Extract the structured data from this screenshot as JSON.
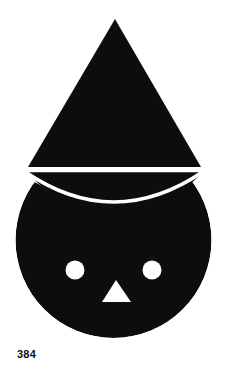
{
  "figure": {
    "caption": "384",
    "background_color": "#ffffff",
    "ink_color": "#0d0d0d",
    "cutout_color": "#ffffff",
    "parts": {
      "hat": {
        "name": "triangular-hat",
        "shape": "triangle",
        "apex_x": 115,
        "apex_y": 19,
        "base_left_x": 28,
        "base_right_x": 201,
        "base_y": 167
      },
      "brim_gap": {
        "name": "horizontal-white-gap",
        "shape": "line",
        "x1": 27,
        "y1": 170.5,
        "x2": 203,
        "y2": 170.5,
        "thickness": 3.4
      },
      "bowl": {
        "name": "hat-underside-bowl",
        "shape": "segment",
        "left_x": 27,
        "right_x": 203,
        "top_y": 172,
        "bottom_y": 222
      },
      "bowl_gap": {
        "name": "curved-white-gap",
        "shape": "arc",
        "start_x": 26,
        "start_y": 172,
        "end_x": 204,
        "end_y": 172,
        "sag_y": 226,
        "thickness": 3.6
      },
      "head": {
        "name": "head-circle",
        "shape": "circle",
        "center_x": 113.5,
        "center_y": 240,
        "radius": 98
      },
      "left_eye": {
        "name": "left-eye",
        "shape": "circle",
        "center_x": 75,
        "center_y": 270,
        "radius": 9.5
      },
      "right_eye": {
        "name": "right-eye",
        "shape": "circle",
        "center_x": 152,
        "center_y": 270,
        "radius": 9.5
      },
      "nose": {
        "name": "nose-triangle",
        "shape": "triangle",
        "apex_x": 116,
        "apex_y": 280,
        "base_left_x": 102,
        "base_right_x": 131,
        "base_y": 302
      }
    }
  }
}
